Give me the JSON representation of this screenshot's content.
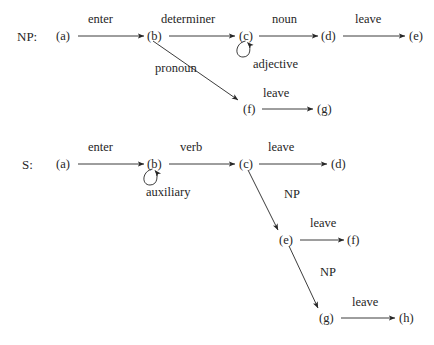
{
  "figure": {
    "name": "finite-state-machine-transition-diagrams",
    "background_color": "#ffffff",
    "ink_color": "#262626"
  },
  "machines": [
    {
      "id": "np",
      "label": "NP:",
      "label_x": 17,
      "label_y": 30,
      "nodes": [
        {
          "id": "np-a",
          "text": "(a)",
          "x": 56,
          "y": 30
        },
        {
          "id": "np-b",
          "text": "(b)",
          "x": 147,
          "y": 30
        },
        {
          "id": "np-c",
          "text": "(c)",
          "x": 239,
          "y": 30
        },
        {
          "id": "np-d",
          "text": "(d)",
          "x": 321,
          "y": 30
        },
        {
          "id": "np-e",
          "text": "(e)",
          "x": 409,
          "y": 30
        },
        {
          "id": "np-f",
          "text": "(f)",
          "x": 243,
          "y": 103
        },
        {
          "id": "np-g",
          "text": "(g)",
          "x": 317,
          "y": 103
        }
      ],
      "edges": [
        {
          "id": "np-enter",
          "label": "enter",
          "label_x": 88,
          "label_y": 13,
          "x1": 78,
          "y1": 36,
          "x2": 144,
          "y2": 36,
          "kind": "straight"
        },
        {
          "id": "np-determiner",
          "label": "determiner",
          "label_x": 161,
          "label_y": 13,
          "x1": 169,
          "y1": 36,
          "x2": 235,
          "y2": 36,
          "kind": "straight"
        },
        {
          "id": "np-noun",
          "label": "noun",
          "label_x": 272,
          "label_y": 13,
          "x1": 259,
          "y1": 36,
          "x2": 318,
          "y2": 36,
          "kind": "straight"
        },
        {
          "id": "np-leave-de",
          "label": "leave",
          "label_x": 355,
          "label_y": 13,
          "x1": 343,
          "y1": 36,
          "x2": 405,
          "y2": 36,
          "kind": "straight"
        },
        {
          "id": "np-adjective",
          "label": "adjective",
          "label_x": 253,
          "label_y": 58,
          "cx": 245,
          "cy": 51,
          "r": 9,
          "kind": "self-loop"
        },
        {
          "id": "np-pronoun",
          "label": "pronoun",
          "label_x": 155,
          "label_y": 62,
          "x1": 153,
          "y1": 41,
          "x2": 238,
          "y2": 100,
          "kind": "straight"
        },
        {
          "id": "np-leave-fg",
          "label": "leave",
          "label_x": 263,
          "label_y": 87,
          "x1": 262,
          "y1": 109,
          "x2": 313,
          "y2": 109,
          "kind": "straight"
        }
      ]
    },
    {
      "id": "s",
      "label": "S:",
      "label_x": 22,
      "label_y": 158,
      "nodes": [
        {
          "id": "s-a",
          "text": "(a)",
          "x": 56,
          "y": 158
        },
        {
          "id": "s-b",
          "text": "(b)",
          "x": 147,
          "y": 158
        },
        {
          "id": "s-c",
          "text": "(c)",
          "x": 239,
          "y": 158
        },
        {
          "id": "s-d",
          "text": "(d)",
          "x": 331,
          "y": 158
        },
        {
          "id": "s-e",
          "text": "(e)",
          "x": 279,
          "y": 234
        },
        {
          "id": "s-f",
          "text": "(f)",
          "x": 347,
          "y": 234
        },
        {
          "id": "s-g",
          "text": "(g)",
          "x": 319,
          "y": 312
        },
        {
          "id": "s-h",
          "text": "(h)",
          "x": 399,
          "y": 312
        }
      ],
      "edges": [
        {
          "id": "s-enter",
          "label": "enter",
          "label_x": 88,
          "label_y": 141,
          "x1": 78,
          "y1": 164,
          "x2": 144,
          "y2": 164,
          "kind": "straight"
        },
        {
          "id": "s-verb",
          "label": "verb",
          "label_x": 180,
          "label_y": 141,
          "x1": 169,
          "y1": 164,
          "x2": 235,
          "y2": 164,
          "kind": "straight"
        },
        {
          "id": "s-leave-cd",
          "label": "leave",
          "label_x": 268,
          "label_y": 141,
          "x1": 259,
          "y1": 164,
          "x2": 327,
          "y2": 164,
          "kind": "straight"
        },
        {
          "id": "s-auxiliary",
          "label": "auxiliary",
          "label_x": 146,
          "label_y": 186,
          "cx": 153,
          "cy": 179,
          "r": 9,
          "kind": "self-loop"
        },
        {
          "id": "s-np-ce",
          "label": "NP",
          "label_x": 284,
          "label_y": 188,
          "x1": 248,
          "y1": 170,
          "x2": 278,
          "y2": 230,
          "kind": "straight"
        },
        {
          "id": "s-leave-ef",
          "label": "leave",
          "label_x": 310,
          "label_y": 217,
          "x1": 300,
          "y1": 240,
          "x2": 344,
          "y2": 240,
          "kind": "straight"
        },
        {
          "id": "s-np-eg",
          "label": "NP",
          "label_x": 320,
          "label_y": 266,
          "x1": 289,
          "y1": 246,
          "x2": 318,
          "y2": 308,
          "kind": "straight"
        },
        {
          "id": "s-leave-gh",
          "label": "leave",
          "label_x": 352,
          "label_y": 296,
          "x1": 341,
          "y1": 318,
          "x2": 395,
          "y2": 318,
          "kind": "straight"
        }
      ]
    }
  ]
}
